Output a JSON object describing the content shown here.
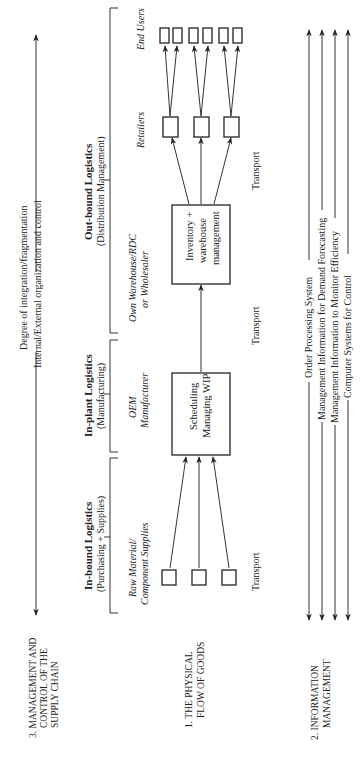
{
  "figure": {
    "sections": {
      "management": {
        "title_line1": "3. MANAGEMENT AND",
        "title_line2": "CONTROL OF THE",
        "title_line3": "SUPPLY CHAIN",
        "axis_label_line1": "Degree of integration/fragmentation",
        "axis_label_line2": "Internal/External organization and control"
      },
      "physical_flow": {
        "title_line1": "1. THE PHYSICAL",
        "title_line2": "FLOW OF GOODS"
      },
      "information": {
        "title_line1": "2. INFORMATION",
        "title_line2": "MANAGEMENT",
        "systems": [
          "Order Processing System",
          "Management Information for Demand Forecasting",
          "Management Information to Monitor Efficiency",
          "Computer Systems for Control"
        ]
      }
    },
    "stages": [
      {
        "name": "In-bound Logistics",
        "sub": "(Purchasing + Supplies)",
        "actor_line1": "Raw Material/",
        "actor_line2": "Component Supplies"
      },
      {
        "name": "In-plant Logistics",
        "sub": "(Manufacturing)",
        "actor_line1": "OEM",
        "actor_line2": "Manufacturer"
      },
      {
        "name": "Out-bound Logistics",
        "sub": "(Distribution Management)",
        "actor_line1": "Own Warehouse/RDC",
        "actor_line2": "or Wholesaler"
      }
    ],
    "boxes": {
      "manufacturing_line1": "Scheduling",
      "manufacturing_line2": "Managing WIP",
      "warehouse_line1": "Inventory +",
      "warehouse_line2": "warehouse",
      "warehouse_line3": "management"
    },
    "labels": {
      "retailers": "Retailers",
      "end_users": "End Users",
      "transport": "Transport"
    }
  }
}
